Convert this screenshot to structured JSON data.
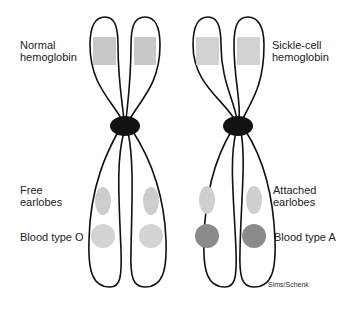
{
  "diagram": {
    "type": "homologous-chromosome-pair",
    "chromosomes": [
      {
        "id": "left-chromosome",
        "genes": [
          {
            "locus": "hemoglobin",
            "label": "Normal hemoglobin",
            "color": "#c8c8c8",
            "shape": "rect"
          },
          {
            "locus": "earlobes",
            "label": "Free earlobes",
            "color": "#cfcfcf",
            "shape": "ellipse"
          },
          {
            "locus": "blood-type",
            "label": "Blood type O",
            "color": "#d3d3d3",
            "shape": "circle"
          }
        ]
      },
      {
        "id": "right-chromosome",
        "genes": [
          {
            "locus": "hemoglobin",
            "label": "Sickle-cell hemoglobin",
            "color": "#d0d0d0",
            "shape": "rect"
          },
          {
            "locus": "earlobes",
            "label": "Attached earlobes",
            "color": "#cfcfcf",
            "shape": "ellipse"
          },
          {
            "locus": "blood-type",
            "label": "Blood type A",
            "color": "#8a8a8a",
            "shape": "circle"
          }
        ]
      }
    ],
    "centromere_color": "#111111",
    "outline_color": "#111111"
  },
  "labels": {
    "normal_hemoglobin": [
      "Normal",
      "hemoglobin"
    ],
    "sickle_cell_hemoglobin": [
      "Sickle-cell",
      "hemoglobin"
    ],
    "free_earlobes": [
      "Free",
      "earlobes"
    ],
    "attached_earlobes": [
      "Attached",
      "earlobes"
    ],
    "blood_type_o": "Blood type O",
    "blood_type_a": "Blood type A"
  },
  "credit": "Sims/Schenk"
}
